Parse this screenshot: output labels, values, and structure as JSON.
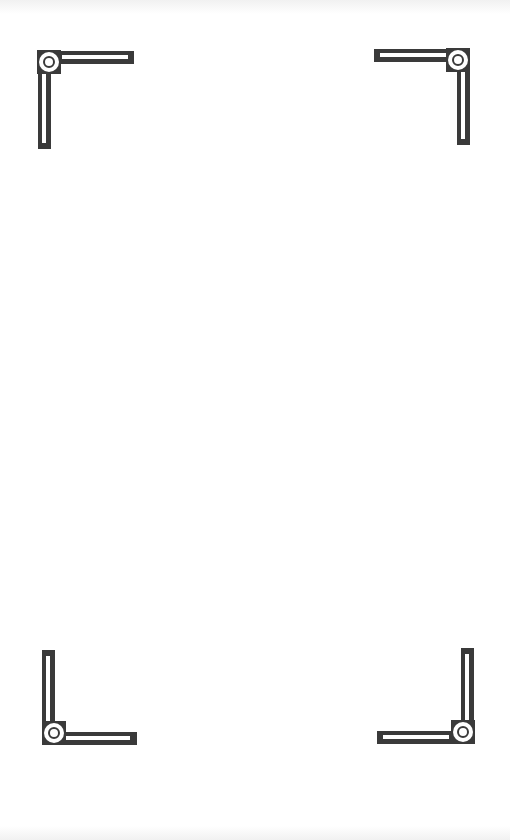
{
  "frame": {
    "background": "#ffffff",
    "ornament_color": "#3a3a3a",
    "corners": [
      {
        "position": "top-left",
        "icon": "corner-bracket-icon"
      },
      {
        "position": "top-right",
        "icon": "corner-bracket-icon"
      },
      {
        "position": "bottom-left",
        "icon": "corner-bracket-icon"
      },
      {
        "position": "bottom-right",
        "icon": "corner-bracket-icon"
      }
    ]
  }
}
